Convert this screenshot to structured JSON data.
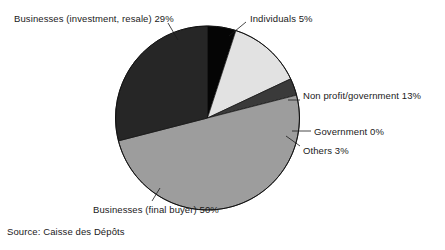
{
  "chart_data": {
    "type": "pie",
    "title": "",
    "subtitle": "",
    "xlabel": "",
    "ylabel": "",
    "legend_position": "callout-labels",
    "grid": false,
    "units": "percent",
    "total": 100,
    "categories": [
      "Individuals",
      "Non profit/government",
      "Government",
      "Others",
      "Businesses (final buyer)",
      "Businesses (investment, resale)"
    ],
    "values": [
      5,
      13,
      0,
      3,
      50,
      29
    ],
    "slices": [
      {
        "name": "Individuals",
        "value": 5,
        "label": "Individuals 5%",
        "color": "#050505",
        "start_angle": 0,
        "end_angle": 18
      },
      {
        "name": "Non profit/government",
        "value": 13,
        "label": "Non profit/government 13%",
        "color": "#e2e2e2",
        "start_angle": 18,
        "end_angle": 64.8
      },
      {
        "name": "Government",
        "value": 0,
        "label": "Government 0%",
        "color": "#555555",
        "start_angle": 64.8,
        "end_angle": 64.8
      },
      {
        "name": "Others",
        "value": 3,
        "label": "Others 3%",
        "color": "#3a3a3a",
        "start_angle": 64.8,
        "end_angle": 75.6
      },
      {
        "name": "Businesses (final buyer)",
        "value": 50,
        "label": "Businesses (final buyer) 50%",
        "color": "#9d9d9d",
        "start_angle": 75.6,
        "end_angle": 255.6
      },
      {
        "name": "Businesses (investment, resale)",
        "value": 29,
        "label": "Businesses (investment, resale) 29%",
        "color": "#262626",
        "start_angle": 255.6,
        "end_angle": 360
      }
    ]
  },
  "labels": {
    "businesses_investment": "Businesses (investment, resale) 29%",
    "individuals": "Individuals 5%",
    "nonprofit": "Non profit/government 13%",
    "government": "Government 0%",
    "others": "Others 3%",
    "businesses_final": "Businesses (final buyer) 50%"
  },
  "source": {
    "text": "Source: Caisse des Dépôts"
  },
  "style": {
    "outline_color": "#111111",
    "background": "#ffffff"
  }
}
